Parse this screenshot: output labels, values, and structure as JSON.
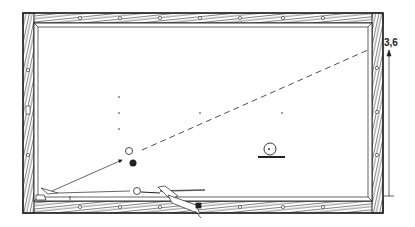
{
  "diagram": {
    "colors": {
      "ink": "#222222",
      "paper": "#ffffff"
    },
    "table": {
      "outer": {
        "x": 23,
        "y": 13,
        "w": 360,
        "h": 200
      },
      "inner": {
        "x": 38,
        "y": 26,
        "w": 330,
        "h": 172
      }
    },
    "diamonds": {
      "top": [
        50,
        80,
        120,
        160,
        200,
        240,
        283,
        323
      ],
      "bottom": [
        80,
        120,
        160,
        200,
        240,
        283,
        323
      ],
      "left": [
        70,
        110,
        155
      ],
      "right": [
        68,
        112,
        155
      ]
    },
    "spots": [
      {
        "x": 119,
        "y": 97
      },
      {
        "x": 119,
        "y": 113
      },
      {
        "x": 119,
        "y": 129
      },
      {
        "x": 200,
        "y": 113
      },
      {
        "x": 282,
        "y": 113
      }
    ],
    "balls": {
      "white_object": {
        "x": 129,
        "y": 151,
        "r": 3.5,
        "fill": "#ffffff"
      },
      "black": {
        "x": 133,
        "y": 163,
        "r": 3.5,
        "fill": "#222222"
      },
      "cue_ball": {
        "x": 137,
        "y": 191,
        "r": 3.5,
        "fill": "#ffffff"
      }
    },
    "side_view_ball": {
      "x": 270,
      "y": 149,
      "r": 6,
      "base_x1": 258,
      "base_x2": 285,
      "base_y": 157
    },
    "paths": {
      "arrow": {
        "x1": 48,
        "y1": 192,
        "x2": 122,
        "y2": 159
      },
      "dashed": {
        "x1": 142,
        "y1": 150,
        "x2": 368,
        "y2": 50
      }
    },
    "measurement": {
      "label": "3,6",
      "x": 389,
      "y_top": 50,
      "y_bottom": 196
    }
  }
}
